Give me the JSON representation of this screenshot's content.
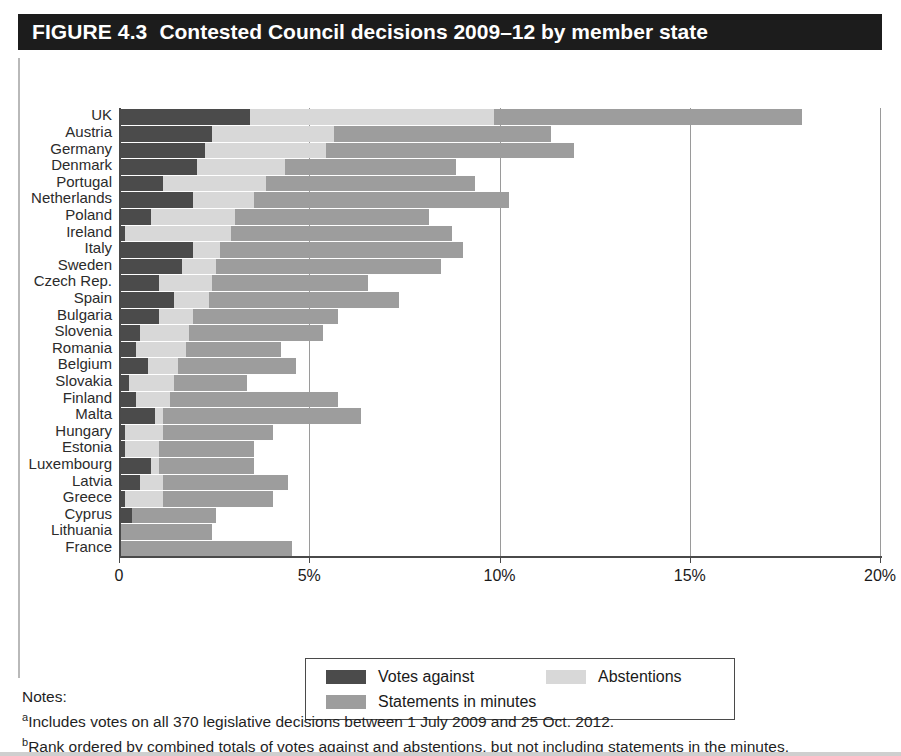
{
  "figure": {
    "number": "FIGURE 4.3",
    "title": "Contested Council decisions 2009–12 by member state"
  },
  "legend": {
    "items": [
      {
        "label": "Votes against",
        "color": "#4b4b4b"
      },
      {
        "label": "Abstentions",
        "color": "#d8d8d8"
      },
      {
        "label": "Statements in minutes",
        "color": "#9d9d9d"
      }
    ]
  },
  "notes": {
    "heading": "Notes:",
    "a_marker": "a",
    "a_text": "Includes votes on all 370 legislative decisions between 1 July 2009 and 25 Oct. 2012.",
    "b_marker": "b",
    "b_text": "Rank ordered by combined totals of votes against and abstentions, but not including statements in the minutes."
  },
  "chart_data": {
    "type": "bar",
    "orientation": "horizontal",
    "stacked": true,
    "title": "Contested Council decisions 2009–12 by member state",
    "xlabel": "",
    "ylabel": "",
    "xlim": [
      0,
      20
    ],
    "xticks": [
      0,
      5,
      10,
      15,
      20
    ],
    "xtick_labels": [
      "0",
      "5%",
      "10%",
      "15%",
      "20%"
    ],
    "grid": "vertical",
    "legend_position": "bottom",
    "categories": [
      "UK",
      "Austria",
      "Germany",
      "Denmark",
      "Portugal",
      "Netherlands",
      "Poland",
      "Ireland",
      "Italy",
      "Sweden",
      "Czech Rep.",
      "Spain",
      "Bulgaria",
      "Slovenia",
      "Romania",
      "Belgium",
      "Slovakia",
      "Finland",
      "Malta",
      "Hungary",
      "Estonia",
      "Luxembourg",
      "Latvia",
      "Greece",
      "Cyprus",
      "Lithuania",
      "France"
    ],
    "series": [
      {
        "name": "Votes against",
        "color": "#4b4b4b",
        "values": [
          3.4,
          2.4,
          2.2,
          2.0,
          1.1,
          1.9,
          0.8,
          0.1,
          1.9,
          1.6,
          1.0,
          1.4,
          1.0,
          0.5,
          0.4,
          0.7,
          0.2,
          0.4,
          0.9,
          0.1,
          0.1,
          0.8,
          0.5,
          0.1,
          0.3,
          0.0,
          0.0
        ]
      },
      {
        "name": "Abstentions",
        "color": "#d8d8d8",
        "values": [
          6.4,
          3.2,
          3.2,
          2.3,
          2.7,
          1.6,
          2.2,
          2.8,
          0.7,
          0.9,
          1.4,
          0.9,
          0.9,
          1.3,
          1.3,
          0.8,
          1.2,
          0.9,
          0.2,
          1.0,
          0.9,
          0.2,
          0.6,
          1.0,
          0.0,
          0.0,
          0.0
        ]
      },
      {
        "name": "Statements in minutes",
        "color": "#9d9d9d",
        "values": [
          8.1,
          5.7,
          6.5,
          4.5,
          5.5,
          6.7,
          5.1,
          5.8,
          6.4,
          5.9,
          4.1,
          5.0,
          3.8,
          3.5,
          2.5,
          3.1,
          1.9,
          4.4,
          5.2,
          2.9,
          2.5,
          2.5,
          3.3,
          2.9,
          2.2,
          2.4,
          4.5
        ]
      }
    ],
    "combined_totals": [
      17.9,
      11.3,
      11.9,
      8.8,
      9.3,
      10.2,
      8.1,
      8.7,
      9.0,
      8.4,
      6.5,
      7.3,
      5.7,
      5.3,
      4.2,
      4.6,
      3.3,
      5.7,
      6.3,
      4.0,
      3.5,
      3.5,
      4.4,
      4.0,
      2.5,
      2.4,
      4.5
    ]
  }
}
